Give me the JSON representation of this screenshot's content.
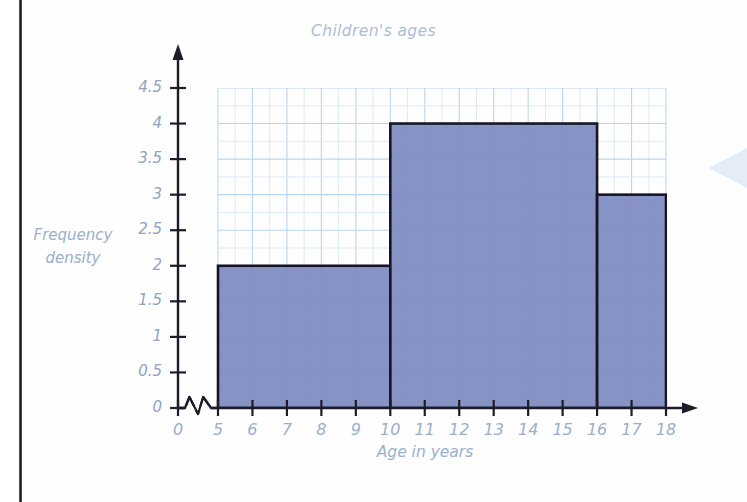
{
  "page": {
    "binding_edge": true
  },
  "chart": {
    "title": "Children's ages",
    "x_axis_label": "Age in years",
    "y_axis_label_line1": "Frequency",
    "y_axis_label_line2": "density",
    "axis_break": true,
    "axis_break_note": "zigzag break between 0 and 5 on the x-axis",
    "x_ticks": [
      "0",
      "5",
      "6",
      "7",
      "8",
      "9",
      "10",
      "11",
      "12",
      "13",
      "14",
      "15",
      "16",
      "17",
      "18"
    ],
    "y_ticks": [
      "0",
      "0.5",
      "1",
      "1.5",
      "2",
      "2.5",
      "3",
      "3.5",
      "4",
      "4.5"
    ],
    "colors": {
      "bar_fill": "#7d8abf",
      "bar_stroke": "#151525",
      "grid_major": "#b9d6ef",
      "grid_minor": "#d8e9f7",
      "axis": "#1c1c2a",
      "tick_text": "#9aafcd",
      "title_text": "#aebcd4",
      "binding": "#1c1c1c",
      "corner_arrow": "#c9dcf0"
    }
  },
  "chart_data": {
    "type": "bar",
    "subtype": "histogram",
    "title": "Children's ages",
    "xlabel": "Age in years",
    "ylabel": "Frequency density",
    "xlim": [
      0,
      18
    ],
    "ylim": [
      0,
      4.5
    ],
    "x_tick_values": [
      0,
      5,
      6,
      7,
      8,
      9,
      10,
      11,
      12,
      13,
      14,
      15,
      16,
      17,
      18
    ],
    "y_tick_values": [
      0,
      0.5,
      1,
      1.5,
      2,
      2.5,
      3,
      3.5,
      4,
      4.5
    ],
    "grid": true,
    "legend": false,
    "axis_break_x": [
      0,
      5
    ],
    "bins": [
      {
        "label": "5-10",
        "x_start": 5,
        "x_end": 10,
        "width": 5,
        "frequency_density": 2,
        "frequency": 10
      },
      {
        "label": "10-16",
        "x_start": 10,
        "x_end": 16,
        "width": 6,
        "frequency_density": 4,
        "frequency": 24
      },
      {
        "label": "16-18",
        "x_start": 16,
        "x_end": 18,
        "width": 2,
        "frequency_density": 3,
        "frequency": 6
      }
    ],
    "categories": [
      "5-10",
      "10-16",
      "16-18"
    ],
    "values": [
      2,
      4,
      3
    ]
  }
}
